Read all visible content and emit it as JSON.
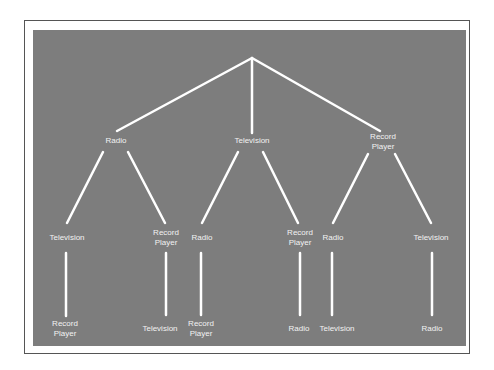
{
  "diagram": {
    "type": "tree",
    "root": "",
    "colors": {
      "background": "#7d7d7d",
      "lines": "#ffffff",
      "text": "#f2f2f2",
      "frame": "#555555"
    },
    "level1": [
      "Radio",
      "Television",
      "Record\nPlayer"
    ],
    "level2": [
      "Television",
      "Record\nPlayer",
      "Radio",
      "Record\nPlayer",
      "Radio",
      "Television"
    ],
    "level3": [
      "Record\nPlayer",
      "Television",
      "Record\nPlayer",
      "Radio",
      "Television",
      "Radio"
    ]
  }
}
